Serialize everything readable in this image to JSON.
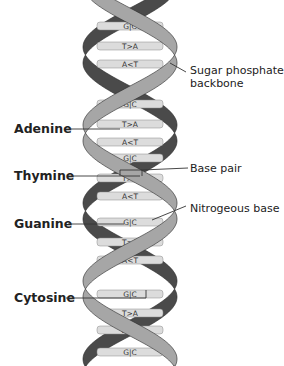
{
  "diagram": {
    "type": "dna-double-helix",
    "colors": {
      "front_strand": "#a6a6a6",
      "back_strand": "#4a4a4a",
      "rung_fill": "#dcdcdc",
      "strand_edge": "#2a2a2a",
      "text": "#222222",
      "background": "#ffffff"
    },
    "base_pairs_cycle": [
      "G|C",
      "T>A",
      "A<T"
    ],
    "rungs": [
      {
        "label": "G|C",
        "y": 26
      },
      {
        "label": "T>A",
        "y": 46
      },
      {
        "label": "A<T",
        "y": 64
      },
      {
        "label": "G|C",
        "y": 104
      },
      {
        "label": "T>A",
        "y": 124
      },
      {
        "label": "A<T",
        "y": 142
      },
      {
        "label": "G|C",
        "y": 158
      },
      {
        "label": "T>A",
        "y": 178
      },
      {
        "label": "A<T",
        "y": 196
      },
      {
        "label": "G|C",
        "y": 222
      },
      {
        "label": "T>A",
        "y": 242
      },
      {
        "label": "A<T",
        "y": 260
      },
      {
        "label": "G|C",
        "y": 294
      },
      {
        "label": "T>A",
        "y": 313
      },
      {
        "label": "A<T",
        "y": 330
      },
      {
        "label": "G|C",
        "y": 352
      }
    ],
    "left_labels": [
      {
        "id": "adenine",
        "text": "Adenine",
        "y": 129
      },
      {
        "id": "thymine",
        "text": "Thymine",
        "y": 176
      },
      {
        "id": "guanine",
        "text": "Guanine",
        "y": 224
      },
      {
        "id": "cytosine",
        "text": "Cytosine",
        "y": 298
      }
    ],
    "right_labels": {
      "sugar_phosphate_line1": "Sugar phosphate",
      "sugar_phosphate_line2": "backbone",
      "base_pair": "Base pair",
      "nitrogenous_base": "Nitrogeous base"
    }
  }
}
